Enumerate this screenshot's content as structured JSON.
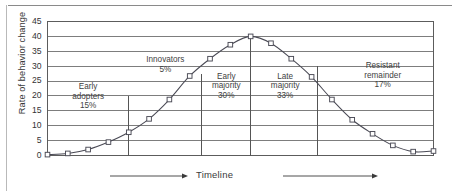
{
  "figure": {
    "name": "diffusion-of-innovations-bell-curve"
  },
  "axes": {
    "y_title": "Rate of behavior change",
    "x_title": "Timeline",
    "y_ticks": [
      "0",
      "5",
      "10",
      "15",
      "20",
      "25",
      "30",
      "35",
      "40",
      "45"
    ]
  },
  "segments": [
    {
      "id": "early-adopters",
      "name_line1": "Early",
      "name_line2": "adopters",
      "percent": "15%"
    },
    {
      "id": "innovators",
      "name_line1": "Innovators",
      "name_line2": "",
      "percent": "5%"
    },
    {
      "id": "early-majority",
      "name_line1": "Early",
      "name_line2": "majority",
      "percent": "30%"
    },
    {
      "id": "late-majority",
      "name_line1": "Late",
      "name_line2": "majority",
      "percent": "33%"
    },
    {
      "id": "resistant-remainder",
      "name_line1": "Resistant",
      "name_line2": "remainder",
      "percent": "17%"
    }
  ],
  "colors": {
    "curve": "#4a4a55",
    "grid": "#6f6f6f",
    "frame": "#5c5c5c",
    "divider": "#555555",
    "text": "#3a3a3a",
    "page_rule": "#8a8a8a"
  },
  "chart_data": {
    "type": "line",
    "title": "",
    "xlabel": "Timeline",
    "ylabel": "Rate of behavior change",
    "ylim": [
      0,
      45
    ],
    "xlim": [
      0,
      19
    ],
    "grid": true,
    "legend": "none",
    "marker": "open-square",
    "x": [
      0,
      1,
      2,
      3,
      4,
      5,
      6,
      7,
      8,
      9,
      10,
      11,
      12,
      13,
      14,
      15,
      16,
      17,
      18,
      19
    ],
    "values": [
      0.3,
      0.7,
      2.0,
      4.5,
      7.8,
      12.3,
      18.8,
      26.7,
      32.5,
      37.2,
      40.0,
      37.7,
      32.5,
      26.4,
      18.8,
      12.0,
      7.3,
      3.4,
      1.3,
      0.7
    ],
    "last_point_value": 1.5,
    "ytick_values": [
      0,
      5,
      10,
      15,
      20,
      25,
      30,
      35,
      40,
      45
    ],
    "dividers": [
      {
        "label": "early-adopters/innovators",
        "x": 4.0,
        "top_value": 20.0
      },
      {
        "label": "innovators/early-majority",
        "x": 7.6,
        "top_value": 27.5
      },
      {
        "label": "early-majority/late-majority",
        "x": 10.0,
        "top_value": 40.0
      },
      {
        "label": "late-majority/resistant-remainder",
        "x": 13.3,
        "top_value": 30.0
      }
    ],
    "annotations": [
      {
        "text": "Early adopters 15%",
        "value": 15
      },
      {
        "text": "Innovators 5%",
        "value": 5
      },
      {
        "text": "Early majority 30%",
        "value": 30
      },
      {
        "text": "Late majority 33%",
        "value": 33
      },
      {
        "text": "Resistant remainder 17%",
        "value": 17
      }
    ]
  }
}
